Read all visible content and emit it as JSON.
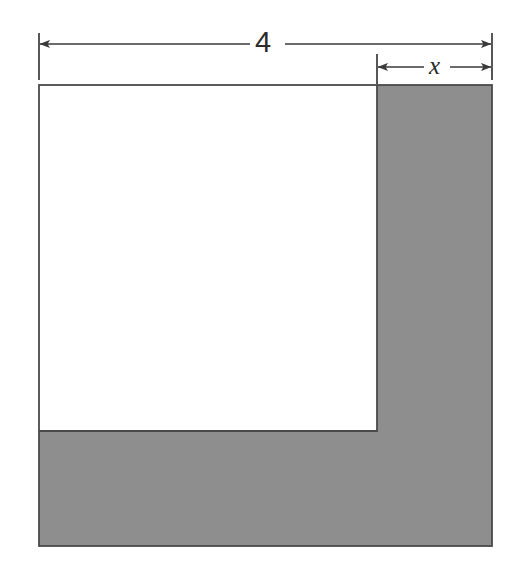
{
  "figure": {
    "type": "geometry-diagram",
    "background_color": "#ffffff",
    "shaded_color": "#8e8e8e",
    "unshaded_color": "#ffffff",
    "outline_color": "#4a4a4a",
    "dimension_line_color": "#3a3a3a"
  },
  "dimensions": [
    {
      "name": "total-width",
      "label": "4",
      "from_x": 39,
      "to_x": 492,
      "line_y": 44,
      "label_x": 267,
      "label_y": 44,
      "arrow_left": true,
      "arrow_right": true
    },
    {
      "name": "strip-width",
      "label": "x",
      "from_x": 377,
      "to_x": 492,
      "line_y": 67,
      "label_x": 437,
      "label_y": 67,
      "arrow_left": true,
      "arrow_right": true,
      "italic": true
    }
  ],
  "shapes": {
    "outer_square": {
      "x": 39,
      "y": 85,
      "width": 453,
      "height": 461
    },
    "inner_white_region": {
      "x": 39,
      "y": 85,
      "width": 338,
      "height": 346
    },
    "shaded_vertical_strip": {
      "x": 377,
      "y": 85,
      "width": 115,
      "height": 461
    },
    "shaded_horizontal_strip": {
      "x": 39,
      "y": 431,
      "width": 338,
      "height": 115
    }
  },
  "extension_lines": [
    {
      "name": "left-extension",
      "x": 39,
      "y1": 33,
      "y2": 80
    },
    {
      "name": "middle-extension",
      "x": 377,
      "y1": 54,
      "y2": 84
    },
    {
      "name": "right-extension",
      "x": 492,
      "y1": 33,
      "y2": 80
    }
  ]
}
